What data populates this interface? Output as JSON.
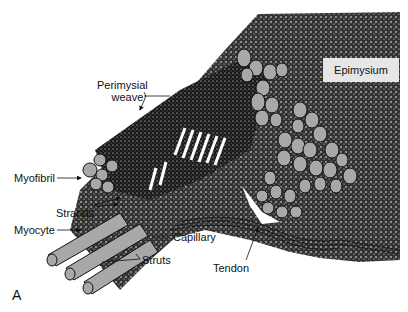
{
  "figure": {
    "panel_label": "A",
    "labels": {
      "perimysial_weave_line1": "Perimysial",
      "perimysial_weave_line2": "weave",
      "epimysium": "Epimysium",
      "myofibril": "Myofibril",
      "strands": "Strands",
      "myocyte": "Myocyte",
      "capillary": "Capillary",
      "struts": "Struts",
      "tendon": "Tendon"
    },
    "colors": {
      "ink": "#111111",
      "fiber_fill": "#a8a8a8",
      "label_box": "#e6e6e6",
      "background": "#ffffff"
    }
  }
}
